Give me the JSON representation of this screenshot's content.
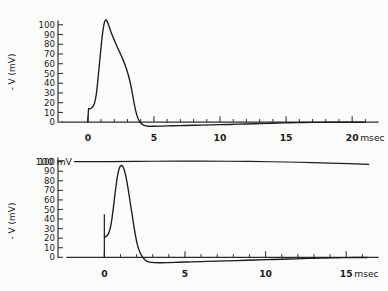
{
  "figure": {
    "name": "action-potential-recordings",
    "background_color": "#fbfbfa",
    "ink_color": "#1c1c1c"
  },
  "chart_data": [
    {
      "type": "line",
      "panel": "top",
      "title": "",
      "xlabel": "msec",
      "ylabel": "- V (mV)",
      "xlim": [
        -1.2,
        21.5
      ],
      "ylim": [
        -6,
        108
      ],
      "grid": false,
      "legend": "none",
      "x_major_ticks": [
        0,
        5,
        10,
        15,
        20
      ],
      "x_major_labels": [
        "0",
        "5",
        "10",
        "15",
        "20"
      ],
      "x_unit_label": "msec",
      "x_minor_tick_step": 1,
      "y_ticks": [
        0,
        10,
        20,
        30,
        40,
        50,
        60,
        70,
        80,
        90,
        100
      ],
      "y_tick_labels": [
        "0",
        "10",
        "20",
        "30",
        "40",
        "50",
        "60",
        "70",
        "80",
        "90",
        "100"
      ],
      "series": [
        {
          "name": "membrane action potential (calculated)",
          "peak_value": 105,
          "peak_time": 1.35,
          "undershoot_min": -4.2,
          "undershoot_time": 4.6,
          "x": [
            0.0,
            0.05,
            0.1,
            0.18,
            0.28,
            0.38,
            0.5,
            0.62,
            0.72,
            0.82,
            0.92,
            1.02,
            1.12,
            1.22,
            1.3,
            1.38,
            1.46,
            1.56,
            1.7,
            1.9,
            2.1,
            2.35,
            2.6,
            2.85,
            3.05,
            3.2,
            3.32,
            3.44,
            3.56,
            3.68,
            3.82,
            4.0,
            4.25,
            4.6,
            5.0,
            5.6,
            6.4,
            7.4,
            8.6,
            10.0,
            11.4,
            12.6,
            13.6,
            14.4,
            15.2,
            16.2,
            17.5,
            19.0,
            21.0
          ],
          "y": [
            0.0,
            13.2,
            13.6,
            14.0,
            14.6,
            16.0,
            19.5,
            27.0,
            38.0,
            52.0,
            66.0,
            80.0,
            92.0,
            100.5,
            104.2,
            105.0,
            103.5,
            100.0,
            94.5,
            87.5,
            81.0,
            73.5,
            66.0,
            57.5,
            49.0,
            41.0,
            33.0,
            24.0,
            15.5,
            8.5,
            3.0,
            -0.8,
            -3.2,
            -4.2,
            -4.2,
            -4.0,
            -3.7,
            -3.4,
            -3.0,
            -2.6,
            -2.1,
            -1.6,
            -1.2,
            -0.9,
            -0.6,
            -0.35,
            -0.2,
            -0.1,
            -0.05
          ]
        }
      ]
    },
    {
      "type": "line",
      "panel": "bottom",
      "title": "",
      "xlabel": "msec",
      "ylabel": "- V (mV)",
      "xlim": [
        -1.2,
        16.6
      ],
      "ylim": [
        -7,
        108
      ],
      "grid": false,
      "legend": "none",
      "x_major_ticks": [
        0,
        5,
        10,
        15
      ],
      "x_major_labels": [
        "0",
        "5",
        "10",
        "15"
      ],
      "x_unit_label": "msec",
      "x_minor_tick_step": 1,
      "y_ticks": [
        0,
        10,
        20,
        30,
        40,
        50,
        60,
        70,
        80,
        90,
        100
      ],
      "y_tick_labels": [
        "0",
        "10",
        "20",
        "30",
        "40",
        "50",
        "60",
        "70",
        "80",
        "90",
        "100"
      ],
      "annotations": [
        {
          "name": "scale-annotation",
          "text": "100 mV",
          "value": 100,
          "kind": "reference-line"
        }
      ],
      "series": [
        {
          "name": "membrane action potential (recorded)",
          "peak_value": 96,
          "peak_time": 1.05,
          "undershoot_min": -5.5,
          "undershoot_time": 3.6,
          "stimulus_artifact": {
            "time": 0.0,
            "top_value": 45,
            "bottom_value": 0
          },
          "x": [
            0.0,
            0.08,
            0.16,
            0.26,
            0.36,
            0.46,
            0.56,
            0.66,
            0.76,
            0.86,
            0.96,
            1.05,
            1.14,
            1.24,
            1.34,
            1.46,
            1.58,
            1.7,
            1.82,
            1.94,
            2.06,
            2.2,
            2.36,
            2.55,
            2.8,
            3.1,
            3.5,
            4.0,
            4.6,
            5.4,
            6.4,
            7.6,
            8.8,
            10.0,
            11.0,
            11.9,
            12.7,
            13.4,
            14.1,
            14.8,
            15.5,
            16.3
          ],
          "y": [
            22.0,
            21.5,
            22.5,
            25.0,
            30.0,
            39.0,
            52.0,
            66.0,
            79.0,
            89.0,
            94.5,
            96.0,
            95.0,
            91.0,
            84.0,
            73.0,
            60.0,
            47.0,
            34.0,
            22.0,
            12.5,
            5.5,
            0.5,
            -3.0,
            -5.0,
            -5.6,
            -5.7,
            -5.5,
            -5.2,
            -4.8,
            -4.3,
            -3.7,
            -3.1,
            -2.5,
            -2.0,
            -1.6,
            -1.2,
            -0.9,
            -0.6,
            -0.4,
            -0.25,
            -0.15
          ]
        },
        {
          "name": "100 mV reference trace",
          "x": [
            0.35,
            3.0,
            6.0,
            9.0,
            12.0,
            14.5,
            16.4
          ],
          "y": [
            100.0,
            100.4,
            100.5,
            100.2,
            99.4,
            98.3,
            97.2
          ]
        }
      ]
    }
  ]
}
